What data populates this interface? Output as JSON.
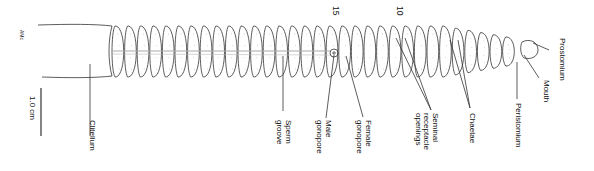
{
  "segment_numbers": {
    "fifteen": "15",
    "ten": "10"
  },
  "scale_bar": {
    "label": "1.0 cm"
  },
  "signature": "AMc",
  "labels": {
    "clitellum": "Clitellum",
    "sperm_groove": "Sperm\ngroove",
    "male_gonopore": "Male\ngonopore",
    "female_gonopore": "Female\ngonopore",
    "seminal_receptacle_openings": "Seminal\nreceptacle\nopenings",
    "chaetae": "Chaetae",
    "peristomium": "Peristomium",
    "mouth": "Mouth",
    "prostomium": "Prostomium"
  },
  "colors": {
    "line": "#333333",
    "background": "#ffffff",
    "groove": "#bbbbbb"
  }
}
